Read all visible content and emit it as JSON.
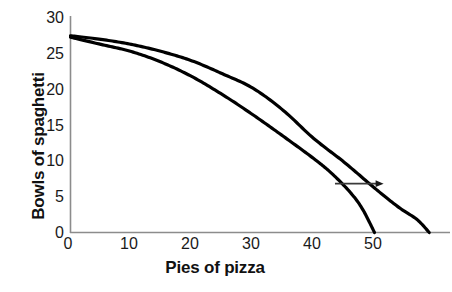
{
  "chart_data": {
    "type": "line",
    "title": "",
    "xlabel": "Pies of pizza",
    "ylabel": "Bowls of spaghetti",
    "xlim": [
      0,
      62
    ],
    "ylim": [
      0,
      30
    ],
    "xticks": [
      "0",
      "10",
      "20",
      "30",
      "40",
      "50"
    ],
    "xtick_values": [
      0,
      10,
      20,
      30,
      40,
      50
    ],
    "yticks": [
      "0",
      "5",
      "10",
      "15",
      "20",
      "25",
      "30"
    ],
    "ytick_values": [
      0,
      5,
      10,
      15,
      20,
      25,
      30
    ],
    "grid": false,
    "legend": null,
    "series": [
      {
        "name": "original production possibilities frontier",
        "x": [
          0,
          5,
          10,
          15,
          20,
          25,
          30,
          35,
          40,
          43,
          46,
          48,
          50
        ],
        "values": [
          27.2,
          26.2,
          25.2,
          23.7,
          21.7,
          19.2,
          16.4,
          13.4,
          10.3,
          8.2,
          5.6,
          3.3,
          0
        ]
      },
      {
        "name": "expanded production possibilities frontier",
        "x": [
          0,
          5,
          10,
          15,
          20,
          25,
          30,
          35,
          40,
          45,
          50,
          54,
          57,
          59
        ],
        "values": [
          27.4,
          26.9,
          26.2,
          25.2,
          23.9,
          22.1,
          20.1,
          17.0,
          13.1,
          9.8,
          6.2,
          3.5,
          1.8,
          0
        ]
      }
    ],
    "annotations": [
      {
        "name": "outward-shift-arrow",
        "type": "arrow",
        "direction": "right",
        "x_start": 43.5,
        "x_end": 51.5,
        "y": 6.8
      }
    ],
    "colors": {
      "curve": "#000000",
      "axis": "#888888",
      "text": "#111111",
      "background": "#ffffff"
    }
  }
}
